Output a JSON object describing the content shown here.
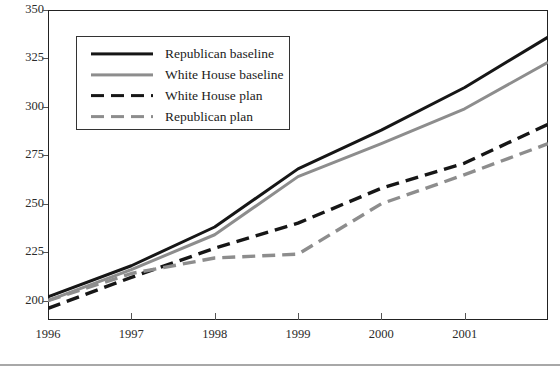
{
  "chart_data": {
    "type": "line",
    "title": "",
    "subtitle": "",
    "xlabel": "",
    "ylabel": "",
    "x": [
      1996,
      1997,
      1998,
      1999,
      2000,
      2001,
      2002
    ],
    "xlim": [
      1996,
      2002
    ],
    "ylim": [
      190,
      350
    ],
    "grid": true,
    "grid_axis": "y",
    "legend_position": "upper-left-inside",
    "xticks": [
      1996,
      1997,
      1998,
      1999,
      2000,
      2001
    ],
    "xtick_labels": [
      "1996",
      "1997",
      "1998",
      "1999",
      "2000",
      "2001"
    ],
    "yticks": [
      200,
      225,
      250,
      275,
      300,
      325,
      350
    ],
    "ytick_labels": [
      "200",
      "225",
      "250",
      "275",
      "300",
      "325",
      "350"
    ],
    "series": [
      {
        "name": "Republican baseline",
        "style": "solid",
        "color": "#161616",
        "width": 3.0,
        "values": [
          202,
          218,
          238,
          268,
          288,
          310,
          336
        ]
      },
      {
        "name": "White House baseline",
        "style": "solid",
        "color": "#8d8d8d",
        "width": 3.0,
        "values": [
          200,
          216,
          234,
          264,
          281,
          299,
          323
        ]
      },
      {
        "name": "White House plan",
        "style": "dashed",
        "color": "#161616",
        "width": 3.4,
        "values": [
          196,
          212,
          227,
          240,
          258,
          271,
          291
        ]
      },
      {
        "name": "Republican plan",
        "style": "dashed",
        "color": "#8d8d8d",
        "width": 3.4,
        "values": [
          200,
          214,
          222,
          224,
          250,
          265,
          281
        ]
      }
    ]
  },
  "legend": {
    "entries": [
      {
        "label": "Republican baseline"
      },
      {
        "label": "White House baseline"
      },
      {
        "label": "White House plan"
      },
      {
        "label": "Republican plan"
      }
    ]
  },
  "colors": {
    "line_black": "#161616",
    "line_gray": "#8d8d8d",
    "grid": "#9a9a9a",
    "frame": "#222222",
    "background": "#ffffff"
  },
  "footer": {
    "rule": true,
    "note": ""
  }
}
